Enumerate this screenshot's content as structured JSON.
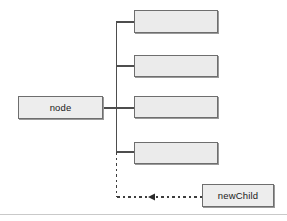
{
  "diagram": {
    "type": "linked-node-tree",
    "parent": {
      "label": "node",
      "x": 18,
      "y": 96,
      "width": 85,
      "height": 23
    },
    "children": [
      {
        "label": "",
        "x": 134,
        "y": 10,
        "width": 84,
        "height": 23,
        "connector_y": 22
      },
      {
        "label": "",
        "x": 134,
        "y": 55,
        "width": 84,
        "height": 22,
        "connector_y": 66
      },
      {
        "label": "",
        "x": 134,
        "y": 96,
        "width": 84,
        "height": 22,
        "connector_y": 108
      },
      {
        "label": "",
        "x": 134,
        "y": 142,
        "width": 84,
        "height": 22,
        "connector_y": 152
      }
    ],
    "new_node": {
      "label": "newChild",
      "x": 202,
      "y": 184,
      "width": 72,
      "height": 23
    },
    "trunk": {
      "x": 116,
      "solid_top": 22,
      "solid_bottom": 152,
      "dashed_bottom": 197
    },
    "insert_arrow": {
      "style": "dotted",
      "direction": "left",
      "from_x": 202,
      "to_x": 116,
      "arrowhead_x": 150,
      "y": 197
    },
    "colors": {
      "box_fill": "#ededed",
      "box_border": "#6e6e6e",
      "box_shadow": "#9a9a9a",
      "line": "#4d4d4d",
      "dashed_line": "#3d3d3d",
      "text": "#1a1a1a",
      "footer_rule": "#c9c9c9",
      "background": "#ffffff"
    }
  }
}
